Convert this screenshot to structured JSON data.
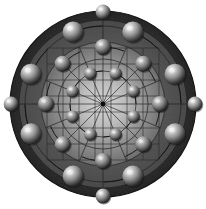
{
  "figure": {
    "background_color": "#ffffff",
    "width": 206,
    "height": 209
  },
  "disk": {
    "center_x": 103,
    "center_y": 104,
    "outer_radius": 93,
    "rim_color": "#2f2f2f",
    "mid_annulus_color": "#4a4a4a",
    "core_highlight_color": "#cfcfcf",
    "core_edge_color": "#6a6a6a",
    "core_radius": 62,
    "mid_radius": 84,
    "edge_color": "#1a1a1a"
  },
  "grid": {
    "spoke_count": 16,
    "spoke_color": "#1c1c1c",
    "spoke_outer_radius": 62,
    "rect_grid_color": "#262626",
    "rect_grid_spacing": 16,
    "rect_grid_extent": 56,
    "rect_grid_visible": true,
    "guide_circle_color": "#1e1e1e",
    "guide_circle_radii": [
      33,
      45,
      62,
      78,
      84
    ],
    "center_dot_color": "#0d0d0d",
    "center_dot_radius": 2.4
  },
  "arcs": {
    "color": "#141414",
    "width": 1.0,
    "sweep_degrees": 22,
    "arrowhead_color": "#000000",
    "arrowhead_size": 3.2,
    "description": "curved tail arcs terminating in arrowheads at each sphere"
  },
  "rings": [
    {
      "name": "inner-ring",
      "radius": 33,
      "sphere_radius": 6.2,
      "count": 8,
      "angle_offset_deg": 22.5,
      "highlight_color": "#e8e8e8",
      "body_color": "#8a8a8a",
      "shadow_color": "#2b2b2b",
      "has_arrows": true
    },
    {
      "name": "middle-ring",
      "radius": 57,
      "sphere_radius": 8.0,
      "count": 8,
      "angle_offset_deg": 0,
      "highlight_color": "#eeeeee",
      "body_color": "#909090",
      "shadow_color": "#262626",
      "has_arrows": true
    },
    {
      "name": "outer-ring",
      "radius": 78,
      "sphere_radius": 10.5,
      "count": 8,
      "angle_offset_deg": 22.5,
      "highlight_color": "#f2f2f2",
      "body_color": "#9a9a9a",
      "shadow_color": "#202020",
      "has_arrows": true
    },
    {
      "name": "rim-ring",
      "radius": 92,
      "sphere_radius": 7.4,
      "count": 4,
      "angle_offset_deg": 0,
      "highlight_color": "#e0e0e0",
      "body_color": "#7e7e7e",
      "shadow_color": "#1c1c1c",
      "has_arrows": false
    }
  ],
  "labels": {
    "caption": ""
  }
}
